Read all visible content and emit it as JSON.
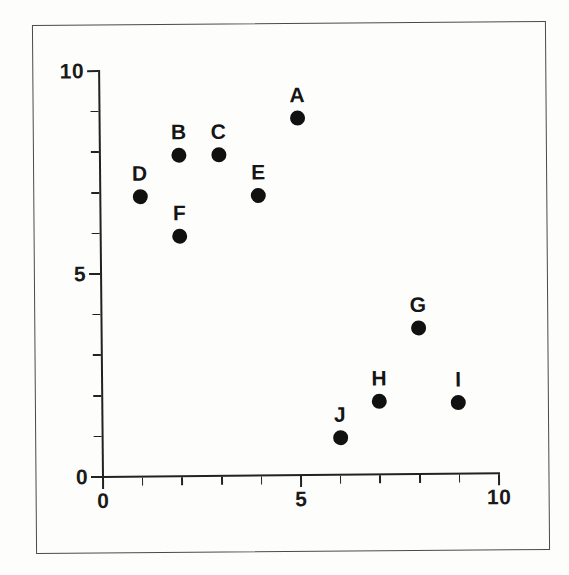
{
  "chart_data": {
    "type": "scatter",
    "title": "",
    "xlabel": "",
    "ylabel": "",
    "xlim": [
      0,
      10
    ],
    "ylim": [
      0,
      10
    ],
    "grid": false,
    "legend": "none",
    "x_tick_labels": [
      "0",
      "5",
      "10"
    ],
    "x_tick_values": [
      0,
      5,
      10
    ],
    "y_tick_labels": [
      "0",
      "5",
      "10"
    ],
    "y_tick_values": [
      0,
      5,
      10
    ],
    "minor_tick_values": [
      0,
      1,
      2,
      3,
      4,
      5,
      6,
      7,
      8,
      9,
      10
    ],
    "points": [
      {
        "label": "A",
        "x": 5,
        "y": 8.8
      },
      {
        "label": "B",
        "x": 2,
        "y": 7.9
      },
      {
        "label": "C",
        "x": 3,
        "y": 7.9
      },
      {
        "label": "D",
        "x": 1,
        "y": 6.9
      },
      {
        "label": "E",
        "x": 4,
        "y": 6.9
      },
      {
        "label": "F",
        "x": 2,
        "y": 5.9
      },
      {
        "label": "G",
        "x": 8,
        "y": 3.6
      },
      {
        "label": "H",
        "x": 7,
        "y": 1.8
      },
      {
        "label": "I",
        "x": 9,
        "y": 1.75
      },
      {
        "label": "J",
        "x": 6,
        "y": 0.9
      }
    ],
    "marker": "filled-circle",
    "marker_color": "#111111",
    "axis_color": "#222222"
  }
}
